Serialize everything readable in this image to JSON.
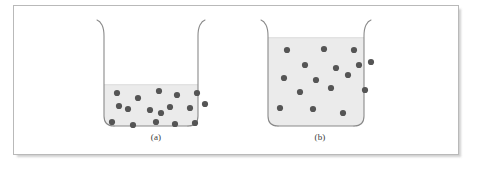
{
  "figure": {
    "background_color": "#ffffff",
    "frame": {
      "border_color": "#b9b9b9",
      "shadow_color": "#d8d8d8"
    },
    "style": {
      "liquid_fill_color": "#ebebeb",
      "liquid_edge_color": "#e2e2e2",
      "glass_outline_color": "#8a8a8a",
      "particle_color": "#555555",
      "particle_radius": 3.1,
      "caption_color": "#3a3a3a"
    },
    "panels": [
      {
        "id": "a",
        "caption": "(a)",
        "description": "beaker with low liquid level and 17 suspended particles",
        "geometry": {
          "left": 91,
          "right": 196,
          "top": 15,
          "bottom": 125,
          "corner_radius": 9,
          "lip_flare": 7,
          "liquid_surface_y": 80
        },
        "particle_count": 17,
        "particles": [
          {
            "x": 13,
            "y": 88
          },
          {
            "x": 34,
            "y": 93
          },
          {
            "x": 55,
            "y": 86
          },
          {
            "x": 73,
            "y": 90
          },
          {
            "x": 93,
            "y": 88
          },
          {
            "x": 24,
            "y": 104
          },
          {
            "x": 46,
            "y": 105
          },
          {
            "x": 66,
            "y": 102
          },
          {
            "x": 86,
            "y": 103
          },
          {
            "x": 101,
            "y": 99
          },
          {
            "x": 8,
            "y": 117
          },
          {
            "x": 29,
            "y": 120
          },
          {
            "x": 52,
            "y": 117
          },
          {
            "x": 71,
            "y": 119
          },
          {
            "x": 91,
            "y": 118
          },
          {
            "x": 57,
            "y": 108
          },
          {
            "x": 15,
            "y": 101
          }
        ]
      },
      {
        "id": "b",
        "caption": "(b)",
        "description": "beaker with high liquid level and 16 suspended particles",
        "geometry": {
          "left": 255,
          "right": 362,
          "top": 15,
          "bottom": 125,
          "corner_radius": 9,
          "lip_flare": 7,
          "liquid_surface_y": 32
        },
        "particle_count": 16,
        "particles": [
          {
            "x": 19,
            "y": 45
          },
          {
            "x": 56,
            "y": 44
          },
          {
            "x": 86,
            "y": 45
          },
          {
            "x": 37,
            "y": 60
          },
          {
            "x": 68,
            "y": 63
          },
          {
            "x": 91,
            "y": 60
          },
          {
            "x": 103,
            "y": 57
          },
          {
            "x": 16,
            "y": 73
          },
          {
            "x": 48,
            "y": 75
          },
          {
            "x": 80,
            "y": 70
          },
          {
            "x": 32,
            "y": 87
          },
          {
            "x": 63,
            "y": 83
          },
          {
            "x": 97,
            "y": 85
          },
          {
            "x": 12,
            "y": 103
          },
          {
            "x": 45,
            "y": 104
          },
          {
            "x": 75,
            "y": 108
          }
        ]
      }
    ]
  }
}
